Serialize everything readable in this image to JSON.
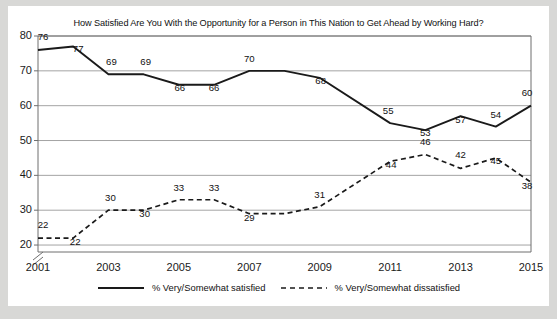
{
  "chart_data": {
    "type": "line",
    "title": "How Satisfied Are You With the Opportunity for a Person in This Nation to Get Ahead by Working Hard?",
    "xlabel": "",
    "ylabel": "",
    "x": [
      2001,
      2002,
      2003,
      2004,
      2005,
      2006,
      2007,
      2008,
      2009,
      2011,
      2012,
      2013,
      2014,
      2015
    ],
    "xtick_labels": [
      "2001",
      "2003",
      "2005",
      "2007",
      "2009",
      "2011",
      "2013",
      "2015"
    ],
    "xticks": [
      2001,
      2003,
      2005,
      2007,
      2009,
      2011,
      2013,
      2015
    ],
    "xlim": [
      2001,
      2015
    ],
    "ytick_labels": [
      "20",
      "30",
      "40",
      "50",
      "60",
      "70",
      "80"
    ],
    "yticks": [
      20,
      30,
      40,
      50,
      60,
      70,
      80
    ],
    "ylim": [
      18,
      80
    ],
    "y_axis_break": true,
    "grid": true,
    "legend_position": "bottom",
    "series": [
      {
        "name": "% Very/Somewhat satisfied",
        "style": "solid",
        "color": "#1a1a1a",
        "x": [
          2001,
          2002,
          2003,
          2004,
          2005,
          2006,
          2007,
          2008,
          2009,
          2011,
          2012,
          2013,
          2014,
          2015
        ],
        "values": [
          76,
          77,
          69,
          69,
          66,
          66,
          70,
          70,
          68,
          55,
          53,
          57,
          54,
          60
        ],
        "labels": [
          "76",
          "77",
          "69",
          "69",
          "66",
          "66",
          "70",
          "",
          "68",
          "55",
          "53",
          "57",
          "54",
          "60"
        ]
      },
      {
        "name": "% Very/Somewhat dissatisfied",
        "style": "dashed",
        "color": "#1a1a1a",
        "x": [
          2001,
          2002,
          2003,
          2004,
          2005,
          2006,
          2007,
          2008,
          2009,
          2011,
          2012,
          2013,
          2014,
          2015
        ],
        "values": [
          22,
          22,
          30,
          30,
          33,
          33,
          29,
          29,
          31,
          44,
          46,
          42,
          45,
          38
        ],
        "labels": [
          "22",
          "22",
          "30",
          "30",
          "33",
          "33",
          "29",
          "",
          "31",
          "44",
          "46",
          "42",
          "45",
          "38"
        ]
      }
    ]
  },
  "legend": {
    "entries": [
      {
        "label": "% Very/Somewhat satisfied",
        "style": "solid"
      },
      {
        "label": "% Very/Somewhat dissatisfied",
        "style": "dashed"
      }
    ]
  },
  "colors": {
    "page_background": "#d8d8d6",
    "card_background": "#ffffff",
    "line": "#1a1a1a",
    "grid": "#9a9a9a",
    "axis": "#6e6e6e",
    "text": "#111111"
  }
}
